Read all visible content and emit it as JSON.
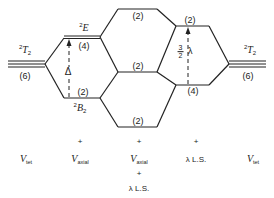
{
  "diagram": {
    "type": "energy-level-correlation-diagram",
    "levels": {
      "left_free": {
        "term": "T",
        "sup": "2",
        "sub": "2",
        "degeneracy": "(6)"
      },
      "E": {
        "term": "E",
        "sup": "2",
        "degeneracy": "(4)"
      },
      "B2": {
        "term": "B",
        "sup": "2",
        "sub": "2",
        "degeneracy": "(2)"
      },
      "split_top": {
        "degeneracy": "(2)"
      },
      "split_mid": {
        "degeneracy": "(2)"
      },
      "split_bot": {
        "degeneracy": "(2)"
      },
      "right_top": {
        "degeneracy": "(2)"
      },
      "right_bot": {
        "degeneracy": "(4)"
      },
      "right_free": {
        "term": "T",
        "sup": "2",
        "sub": "2",
        "degeneracy": "(6)"
      }
    },
    "gaps": {
      "delta": "Δ",
      "lambda_num": "3",
      "lambda_den": "2",
      "lambda_sym": "λ"
    },
    "columns": [
      {
        "v": "V",
        "sub": "tet",
        "prefix": "",
        "extra": ""
      },
      {
        "v": "V",
        "sub": "axial",
        "prefix": "+",
        "extra": ""
      },
      {
        "v": "V",
        "sub": "axial",
        "prefix": "+",
        "extra": "+",
        "extra2": "λ L.S."
      },
      {
        "text": "λ L.S.",
        "prefix": "+"
      },
      {
        "v": "V",
        "sub": "tet",
        "prefix": ""
      }
    ]
  }
}
